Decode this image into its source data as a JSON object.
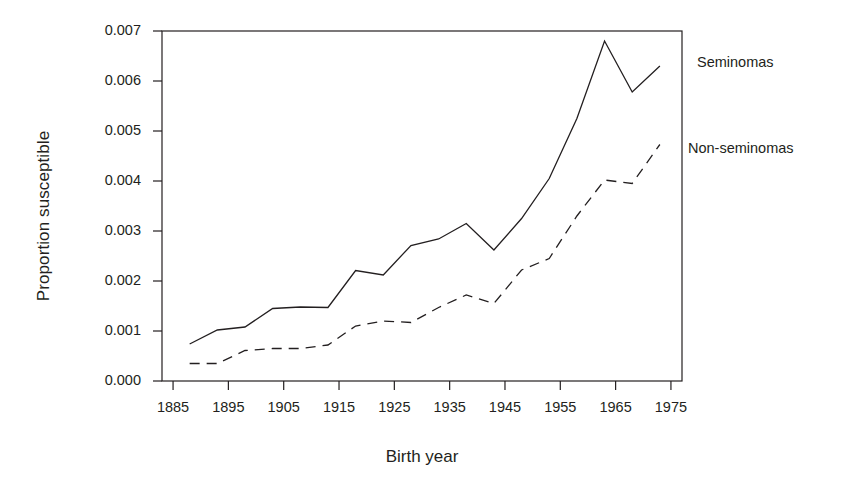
{
  "chart_data": {
    "type": "line",
    "title": "",
    "xlabel": "Birth year",
    "ylabel": "Proportion susceptible",
    "xlim": [
      1883,
      1977
    ],
    "ylim": [
      0.0,
      0.007
    ],
    "xticks": [
      1885,
      1895,
      1905,
      1915,
      1925,
      1935,
      1945,
      1955,
      1965,
      1975
    ],
    "yticks": [
      "0.000",
      "0.001",
      "0.002",
      "0.003",
      "0.004",
      "0.005",
      "0.006",
      "0.007"
    ],
    "ytick_values": [
      0.0,
      0.001,
      0.002,
      0.003,
      0.004,
      0.005,
      0.006,
      0.007
    ],
    "grid": false,
    "legend_position": "right-outside",
    "x": [
      1888,
      1893,
      1898,
      1903,
      1908,
      1913,
      1918,
      1923,
      1928,
      1933,
      1938,
      1943,
      1948,
      1953,
      1958,
      1963,
      1968,
      1973
    ],
    "series": [
      {
        "name": "Seminomas",
        "linestyle": "solid",
        "color": "#231f20",
        "values": [
          0.00074,
          0.00102,
          0.00108,
          0.00145,
          0.00148,
          0.00147,
          0.00221,
          0.00212,
          0.00271,
          0.00284,
          0.00315,
          0.00262,
          0.00325,
          0.00405,
          0.00525,
          0.0068,
          0.00578,
          0.0063
        ]
      },
      {
        "name": "Non-seminomas",
        "linestyle": "dashed",
        "color": "#231f20",
        "values": [
          0.00035,
          0.00035,
          0.00061,
          0.00065,
          0.00065,
          0.00072,
          0.0011,
          0.0012,
          0.00117,
          0.00147,
          0.00172,
          0.00155,
          0.00222,
          0.00245,
          0.0033,
          0.00402,
          0.00395,
          0.00473
        ]
      }
    ],
    "annotations": [
      {
        "text": "Seminomas",
        "x_px": 697,
        "y_px": 63
      },
      {
        "text": "Non-seminomas",
        "x_px": 688,
        "y_px": 149
      }
    ]
  },
  "axes": {
    "plot_left_px": 162,
    "plot_right_px": 682,
    "plot_top_px": 31,
    "plot_bottom_px": 381
  }
}
